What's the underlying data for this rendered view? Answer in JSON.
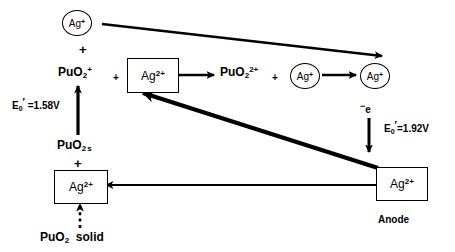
{
  "diagram": {
    "nodes": {
      "top_silver_circle": "Ag+",
      "plus_top": "+",
      "pu_o2_plus": "PuO2+",
      "plus_mid_1": "+",
      "ag_2plus_box_mid": "Ag2+",
      "pu_o2_2plus": "PuO2 2+",
      "plus_mid_2": "+",
      "ag_plus_circle_mid": "Ag+",
      "ag_plus_circle_right": "Ag+",
      "pu_o2_s": "PuO2",
      "pu_o2_s_state": "s",
      "plus_left_lower": "+",
      "ag_2plus_box_bottom": "Ag2+",
      "pu_o2_solid": "PuO2",
      "pu_o2_solid_state": "solid",
      "ag_2plus_box_anode": "Ag2+",
      "anode_label": "Anode",
      "electron_label": "-e"
    },
    "potentials": {
      "left": {
        "symbol": "E",
        "subscript": "0",
        "prime": "'",
        "value": "=1.58V",
        "full": "E0' =1.58V"
      },
      "right": {
        "symbol": "E",
        "subscript": "0",
        "prime": "'",
        "value": "=1.92V",
        "full": "E0' =1.92V"
      }
    },
    "colors": {
      "ink": "#000000",
      "background": "#ffffff"
    }
  }
}
